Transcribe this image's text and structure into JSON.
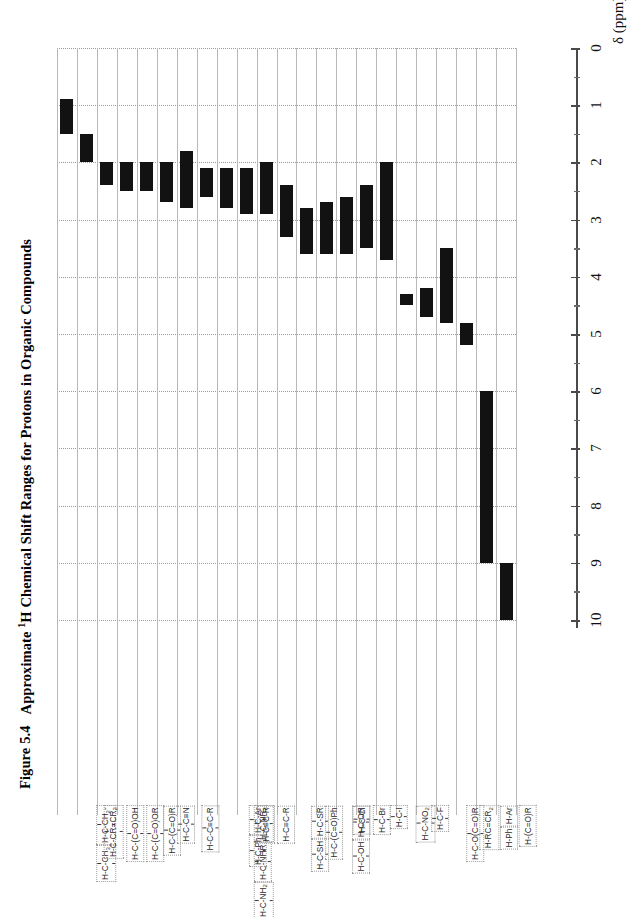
{
  "figure": {
    "number": "Figure 5.4",
    "title_pre": "Approximate ",
    "title_sup": "1",
    "title_post": "H Chemical Shift Ranges for Protons in Organic Compounds",
    "full_title": "Figure 5.4  Approximate 1H Chemical Shift Ranges for Protons in Organic Compounds"
  },
  "axis": {
    "title": "δ (ppm)",
    "tick_labels": [
      "0",
      "1",
      "2",
      "3",
      "4",
      "5",
      "6",
      "7",
      "8",
      "9",
      "10"
    ],
    "min": 0,
    "max": 10,
    "direction": "top-to-bottom",
    "minor_tick_step": 0.5
  },
  "colors": {
    "bar": "#121212",
    "gridline": "#9a9a9a",
    "column_separator": "#b9b9b9",
    "axis": "#4a4a4a",
    "text": "#111111",
    "background": "#ffffff"
  },
  "chart_data": {
    "type": "bar",
    "orientation": "vertical-ranges",
    "title": "Approximate 1H Chemical Shift Ranges for Protons in Organic Compounds",
    "xlabel": "",
    "ylabel": "δ (ppm)",
    "ylim": [
      0,
      10
    ],
    "y_inverted": true,
    "grid": "horizontal-dotted",
    "legend": "none",
    "categories": [
      "H-C-CH3 / H-C-CH2-",
      "H-C-CR=CR2",
      "H-C-(C=O)OH",
      "H-C-(C=O)OR",
      "H-C-(C=O)R",
      "H-C-C≡N",
      "H-C-C≡C-R",
      "H-C-NH2 / H-C-NHR / H-C-NR2",
      "H-C-Ph / H-C-Ar",
      "H-C≡C-R",
      "H-C≡C-R",
      "H-C-SH / H-C-SR",
      "H-C-(C=O)Ph",
      "H-C-OH / H-C-OR",
      "H-C-Cl",
      "H-C-Br",
      "H-C-I",
      "H-C-NO2",
      "H-C-F",
      "H-C-O(C=O)R",
      "H-RC=CR2",
      "H-Ph / H-Ar",
      "H-(C=O)R"
    ],
    "ranges": [
      {
        "label": "H-C-CH3 / H-C-CH2-",
        "low": 0.9,
        "high": 1.5
      },
      {
        "label": "H-C-CR=CR2",
        "low": 1.5,
        "high": 2.0
      },
      {
        "label": "H-C-(C=O)OH",
        "low": 2.0,
        "high": 2.4
      },
      {
        "label": "H-C-(C=O)OR",
        "low": 2.0,
        "high": 2.5
      },
      {
        "label": "H-C-(C=O)R",
        "low": 2.0,
        "height_note": "",
        "high": 2.5
      },
      {
        "label": "H-C-C≡N",
        "low": 2.0,
        "high": 2.7
      },
      {
        "label": "H-C-C≡C-R",
        "low": 1.8,
        "high": 2.8
      },
      {
        "label": "H-C-NH2/NHR/NR2",
        "low": 2.1,
        "high": 2.6
      },
      {
        "label": "H-C-Ph / H-C-Ar",
        "low": 2.1,
        "high": 2.8
      },
      {
        "label": "H-C≡C-R",
        "low": 2.1,
        "high": 2.9
      },
      {
        "label": "H-C≡C-R (b)",
        "low": 2.0,
        "high": 2.9
      },
      {
        "label": "H-C-SH / H-C-SR",
        "low": 2.4,
        "high": 3.3
      },
      {
        "label": "H-C-(C=O)Ph",
        "low": 2.8,
        "high": 3.6
      },
      {
        "label": "H-C-OH / H-C-OR",
        "low": 2.7,
        "high": 3.6
      },
      {
        "label": "H-C-Cl",
        "low": 2.6,
        "high": 3.6
      },
      {
        "label": "H-C-Br",
        "low": 2.4,
        "high": 3.5
      },
      {
        "label": "H-C-I",
        "low": 2.0,
        "high": 3.7
      },
      {
        "label": "H-C-NO2",
        "low": 4.3,
        "high": 4.5
      },
      {
        "label": "H-C-F",
        "low": 4.2,
        "high": 4.7
      },
      {
        "label": "H-C-O(C=O)R",
        "low": 3.5,
        "high": 4.8
      },
      {
        "label": "H-RC=CR2",
        "low": 4.8,
        "high": 5.2
      },
      {
        "label": "H-Ph / H-Ar",
        "low": 6.0,
        "high": 9.0
      },
      {
        "label": "H-(C=O)R",
        "low": 9.0,
        "high": 10.0
      }
    ]
  },
  "compounds": [
    {
      "name": "alkyl-methyl-methylene",
      "fragments": [
        {
          "boxed": true,
          "bonds": true,
          "text": "H-C-CH3"
        },
        {
          "boxed": true,
          "bonds": true,
          "text": "H-C-CH2-"
        }
      ]
    },
    {
      "name": "allylic",
      "fragments": [
        {
          "boxed": true,
          "bonds": true,
          "text": "H-C-CR=CR2"
        }
      ]
    },
    {
      "name": "carboxylic-acid-alpha",
      "fragments": [
        {
          "boxed": true,
          "bonds": true,
          "text": "H-C-(C=O)OH"
        }
      ]
    },
    {
      "name": "ester-alpha",
      "fragments": [
        {
          "boxed": true,
          "bonds": true,
          "text": "H-C-(C=O)OR"
        }
      ]
    },
    {
      "name": "ketone-alpha",
      "fragments": [
        {
          "boxed": true,
          "bonds": true,
          "text": "H-C-(C=O)R"
        }
      ]
    },
    {
      "name": "nitrile-alpha",
      "fragments": [
        {
          "boxed": true,
          "bonds": true,
          "text": "H-C-C≡N"
        }
      ]
    },
    {
      "name": "propargylic",
      "fragments": [
        {
          "boxed": true,
          "bonds": true,
          "text": "H-C-C≡C-R"
        }
      ]
    },
    {
      "name": "amine-alpha",
      "fragments": [
        {
          "boxed": true,
          "bonds": true,
          "text": "H-C-NH2"
        },
        {
          "boxed": true,
          "bonds": true,
          "text": "H-C-NHR"
        },
        {
          "boxed": true,
          "bonds": true,
          "text": "H-C-NR2"
        }
      ]
    },
    {
      "name": "benzylic",
      "fragments": [
        {
          "boxed": true,
          "bonds": true,
          "text": "H-C-Ph"
        },
        {
          "boxed": true,
          "bonds": true,
          "text": "H-C-Ar"
        }
      ]
    },
    {
      "name": "alkyne-terminal-a",
      "fragments": [
        {
          "boxed": true,
          "bonds": false,
          "text": "H-C≡C-R"
        }
      ]
    },
    {
      "name": "alkyne-terminal-b",
      "fragments": [
        {
          "boxed": true,
          "bonds": false,
          "text": "H-C≡C-R"
        }
      ]
    },
    {
      "name": "thiol-sulfide-alpha",
      "fragments": [
        {
          "boxed": true,
          "bonds": true,
          "text": "H-C-SH"
        },
        {
          "boxed": true,
          "bonds": true,
          "text": "H-C-SR"
        }
      ]
    },
    {
      "name": "aryl-ketone-alpha",
      "fragments": [
        {
          "boxed": true,
          "bonds": true,
          "text": "H-C-(C=O)Ph"
        }
      ]
    },
    {
      "name": "alcohol-ether-alpha",
      "fragments": [
        {
          "boxed": true,
          "bonds": true,
          "text": "H-C-OH"
        },
        {
          "boxed": true,
          "bonds": true,
          "text": "H-C-OR"
        }
      ]
    },
    {
      "name": "chloride",
      "fragments": [
        {
          "boxed": true,
          "bonds": true,
          "text": "H-C-Cl"
        }
      ]
    },
    {
      "name": "bromide",
      "fragments": [
        {
          "boxed": true,
          "bonds": true,
          "text": "H-C-Br"
        }
      ]
    },
    {
      "name": "iodide",
      "fragments": [
        {
          "boxed": true,
          "bonds": true,
          "text": "H-C-I"
        }
      ]
    },
    {
      "name": "nitro",
      "fragments": [
        {
          "boxed": true,
          "bonds": true,
          "text": "H-C-NO2"
        }
      ]
    },
    {
      "name": "fluoride",
      "fragments": [
        {
          "boxed": true,
          "bonds": true,
          "text": "H-C-F"
        }
      ]
    },
    {
      "name": "ester-oxygen-alpha",
      "fragments": [
        {
          "boxed": true,
          "bonds": true,
          "text": "H-C-O(C=O)R"
        }
      ]
    },
    {
      "name": "vinylic",
      "fragments": [
        {
          "boxed": true,
          "bonds": false,
          "text": "H-RC=CR2"
        }
      ]
    },
    {
      "name": "aromatic",
      "fragments": [
        {
          "boxed": true,
          "bonds": false,
          "text": "H-Ph"
        },
        {
          "boxed": true,
          "bonds": false,
          "text": "H-Ar"
        }
      ]
    },
    {
      "name": "aldehyde",
      "fragments": [
        {
          "boxed": true,
          "bonds": false,
          "text": "H-(C=O)R"
        }
      ]
    }
  ]
}
